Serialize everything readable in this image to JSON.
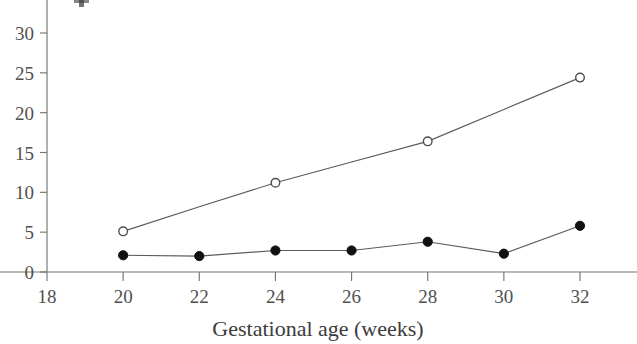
{
  "chart_data": {
    "type": "line",
    "title": "",
    "xlabel": "Gestational age (weeks)",
    "ylabel": "",
    "x": [
      20,
      22,
      24,
      26,
      28,
      30,
      32
    ],
    "xlim": [
      18,
      33
    ],
    "ylim": [
      0,
      32.5
    ],
    "xticks": [
      18,
      20,
      22,
      24,
      26,
      28,
      30,
      32
    ],
    "xtick_labels": [
      "18",
      "20",
      "22",
      "24",
      "26",
      "28",
      "30",
      "32"
    ],
    "yticks": [
      0,
      5,
      10,
      15,
      20,
      25,
      30
    ],
    "ytick_labels": [
      "0",
      "5",
      "10",
      "15",
      "20",
      "25",
      "30"
    ],
    "grid": false,
    "legend": "none",
    "series": [
      {
        "name": "open-circle-series",
        "marker": "open-circle",
        "marker_x": [
          20,
          24,
          28,
          32
        ],
        "x": [
          20,
          22,
          24,
          26,
          28,
          30,
          32
        ],
        "values": [
          5.1,
          8.2,
          11.2,
          13.8,
          16.4,
          20.4,
          24.4
        ]
      },
      {
        "name": "filled-circle-series",
        "marker": "filled-circle",
        "marker_x": [
          20,
          22,
          24,
          26,
          28,
          30,
          32
        ],
        "x": [
          20,
          22,
          24,
          26,
          28,
          30,
          32
        ],
        "values": [
          2.1,
          2.0,
          2.7,
          2.7,
          3.8,
          2.3,
          5.8
        ]
      }
    ]
  },
  "axis": {
    "x_title": "Gestational age (weeks)"
  }
}
